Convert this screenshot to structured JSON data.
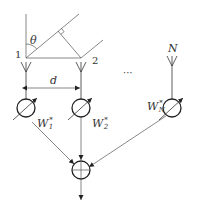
{
  "diagram": {
    "elements": [
      {
        "id": "1",
        "label": "1",
        "x": 26,
        "weight": "W",
        "weight_sub": "1",
        "weight_sup": "*"
      },
      {
        "id": "2",
        "label": "2",
        "x": 81,
        "weight": "W",
        "weight_sub": "2",
        "weight_sup": "*"
      },
      {
        "id": "N",
        "label": "N",
        "x": 172,
        "weight": "W",
        "weight_sub": "N",
        "weight_sup": "*"
      }
    ],
    "angle_label": "θ",
    "spacing_label": "d",
    "ellipsis": "···",
    "summer_symbol": "+",
    "colors": {
      "line": "#333333",
      "background": "#ffffff"
    }
  }
}
